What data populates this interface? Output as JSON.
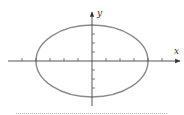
{
  "diagram": {
    "type": "ellipse-on-axes",
    "labels": {
      "x_axis": "x",
      "y_axis": "y"
    },
    "colors": {
      "axis": "#444444",
      "ellipse": "#888888",
      "ticks": "#555555",
      "separator": "#aaaaaa"
    },
    "ellipse": {
      "cx_units": 0,
      "cy_units": 0,
      "a_units": 4,
      "b_units": 4,
      "note": "horizontal semi-axis spans 4 x-ticks, vertical spans 4 y-ticks"
    },
    "x_ticks": [
      -5,
      -4,
      -3,
      -2,
      -1,
      1,
      2,
      3,
      4,
      5
    ],
    "y_ticks": [
      -3,
      -2,
      -1,
      1,
      2,
      3
    ]
  }
}
